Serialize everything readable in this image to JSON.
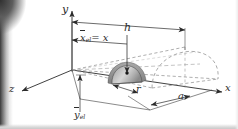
{
  "figure": {
    "type": "technical-diagram",
    "axes": {
      "x_label": "x",
      "y_label": "y",
      "z_label": "z"
    },
    "dimensions": {
      "height_label": "h",
      "radius_base_label": "a",
      "element_radius_label": "r"
    },
    "element_labels": {
      "x_centroid": "x",
      "x_centroid_sub": "el",
      "x_centroid_equals": "= x",
      "y_centroid": "y",
      "y_centroid_sub": "el"
    },
    "colors": {
      "line": "#2b2b2b",
      "dashed": "#8d8d8d",
      "element_fill": "#9a9a9a",
      "element_highlight": "#d8d8d8",
      "background": "#ffffff",
      "binding_shadow": "#3a3a3a"
    }
  }
}
